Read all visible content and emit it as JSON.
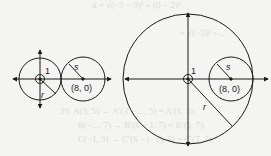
{
  "figure_left": {
    "label_one": "1",
    "label_r": "r",
    "label_s": "s",
    "label_center": "(8, 0)"
  },
  "figure_right": {
    "label_one": "1",
    "label_r": "r",
    "label_s": "s",
    "label_center": "(8, 0)"
  },
  "bleed_text": [
    "d = √(−5 − 0)² + (0 − 2)²",
    "= √(−5)² + ...",
    "29. A(3, 5) → A′(3 − ..., 5) = A′(1, 5);",
    "B(−..., 7) → B′(6 − 1, 7) = B′(5, 7);",
    "C(−1, 5) → C′(6 − (−1), 5) = C′(7, 5);"
  ],
  "colors": {
    "stroke": "#1a1a1a",
    "background": "#f4f4f2"
  }
}
